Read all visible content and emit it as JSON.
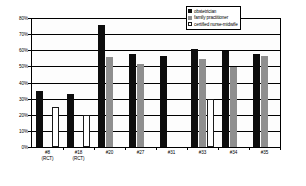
{
  "chart_data": {
    "type": "bar",
    "title": "",
    "xlabel": "",
    "ylabel": "",
    "ylim": [
      0,
      80
    ],
    "ytick_labels": [
      "80%",
      "70%",
      "60%",
      "50%",
      "40%",
      "30%",
      "20%",
      "10%",
      "0%"
    ],
    "ytick_values": [
      80,
      70,
      60,
      50,
      40,
      30,
      20,
      10,
      0
    ],
    "grid": true,
    "legend_position": "top-right",
    "categories": [
      "#8\n(RCT)",
      "#18\n(RCT)",
      "#20",
      "#27",
      "#31",
      "#33",
      "#34",
      "#35"
    ],
    "category_lines": [
      [
        "#8",
        "(RCT)"
      ],
      [
        "#18",
        "(RCT)"
      ],
      [
        "#20",
        ""
      ],
      [
        "#27",
        ""
      ],
      [
        "#31",
        ""
      ],
      [
        "#33",
        ""
      ],
      [
        "#34",
        ""
      ],
      [
        "#35",
        ""
      ]
    ],
    "series": [
      {
        "name": "obstetrician",
        "color": "#0d0d0d",
        "values": [
          35,
          33,
          76,
          58,
          57,
          61,
          60,
          58
        ]
      },
      {
        "name": "family practitioner",
        "color": "#8f8f8f",
        "values": [
          null,
          null,
          56,
          52,
          null,
          55,
          50,
          57
        ]
      },
      {
        "name": "certified nurse-midwife",
        "color": "#ffffff",
        "values": [
          25,
          20,
          null,
          null,
          null,
          30,
          null,
          null
        ]
      }
    ]
  },
  "legend": {
    "items": [
      {
        "label": "obstetrician",
        "swatch": "black-square-swatch"
      },
      {
        "label": "family practitioner",
        "swatch": "grey-square-swatch"
      },
      {
        "label": "certified nurse-midwife",
        "swatch": "white-square-swatch"
      }
    ]
  }
}
